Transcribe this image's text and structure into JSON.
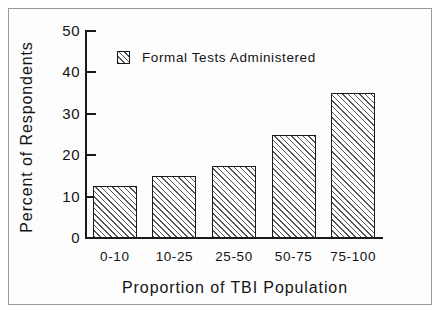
{
  "chart_data": {
    "type": "bar",
    "title": "",
    "subtitle": "",
    "xlabel": "Proportion of TBI Population",
    "ylabel": "Percent of Respondents",
    "categories": [
      "0-10",
      "10-25",
      "25-50",
      "50-75",
      "75-100"
    ],
    "values": [
      12.5,
      15,
      17.5,
      25,
      35
    ],
    "series": [
      {
        "name": "Formal Tests Administered",
        "values": [
          12.5,
          15,
          17.5,
          25,
          35
        ]
      }
    ],
    "ylim": [
      0,
      50
    ],
    "yticks": [
      0,
      10,
      20,
      30,
      40,
      50
    ],
    "ytick_labels": [
      "0",
      "10",
      "20",
      "30",
      "40",
      "50"
    ],
    "grid": false,
    "legend": {
      "position": "upper-left-inside",
      "entries": [
        {
          "label": "Formal Tests Administered",
          "swatch": "diagonal-hatch"
        }
      ]
    },
    "style": {
      "bar_fill": "#ffffff",
      "bar_hatch_color": "#555555",
      "bar_edge": "#1a1a1a",
      "axis_color": "#1a1a1a",
      "text_color": "#141414",
      "frame_border": "#9a9a9a",
      "background": "#ffffff"
    }
  }
}
